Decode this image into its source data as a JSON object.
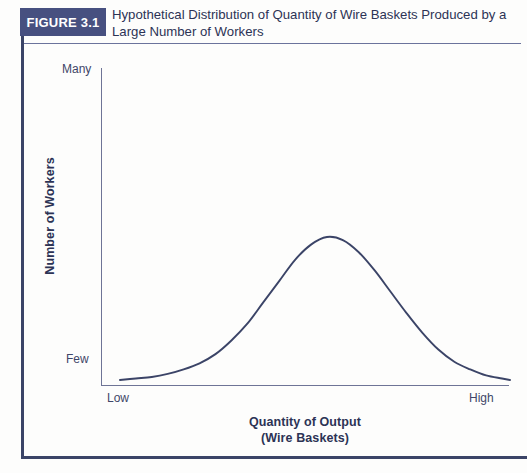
{
  "figure": {
    "badge_label": "FIGURE 3.1",
    "title": "Hypothetical Distribution of Quantity of Wire Baskets Produced by a Large Number of Workers",
    "badge_color": "#475080",
    "text_color": "#2c3355",
    "curve_color": "#3b4467",
    "axis_color": "#6e7496"
  },
  "chart_data": {
    "type": "line",
    "title": "Hypothetical Distribution of Quantity of Wire Baskets Produced by a Large Number of Workers",
    "subtitle": "",
    "xlabel": "Quantity of Output",
    "xlabel_line2": "(Wire Baskets)",
    "ylabel": "Number of Workers",
    "grid": false,
    "legend": false,
    "legend_position": "none",
    "xtick_labels": [
      "Low",
      "High"
    ],
    "ytick_labels": [
      "Few",
      "Many"
    ],
    "xlim": [
      0,
      100
    ],
    "ylim": [
      0,
      100
    ],
    "annotations": [],
    "series": [
      {
        "name": "Distribution of workers",
        "description": "Symmetric bell-shaped (normal) distribution peaking near the middle of the output range",
        "x": [
          2,
          6,
          10,
          14,
          18,
          22,
          26,
          30,
          34,
          38,
          42,
          46,
          50,
          54,
          58,
          62,
          66,
          70,
          74,
          78,
          82,
          86,
          90,
          94,
          98,
          100
        ],
        "y": [
          4,
          5,
          6,
          8,
          11,
          15,
          21,
          30,
          41,
          55,
          69,
          83,
          93,
          98,
          96,
          88,
          76,
          62,
          48,
          35,
          24,
          16,
          11,
          7,
          5,
          4
        ]
      }
    ]
  }
}
